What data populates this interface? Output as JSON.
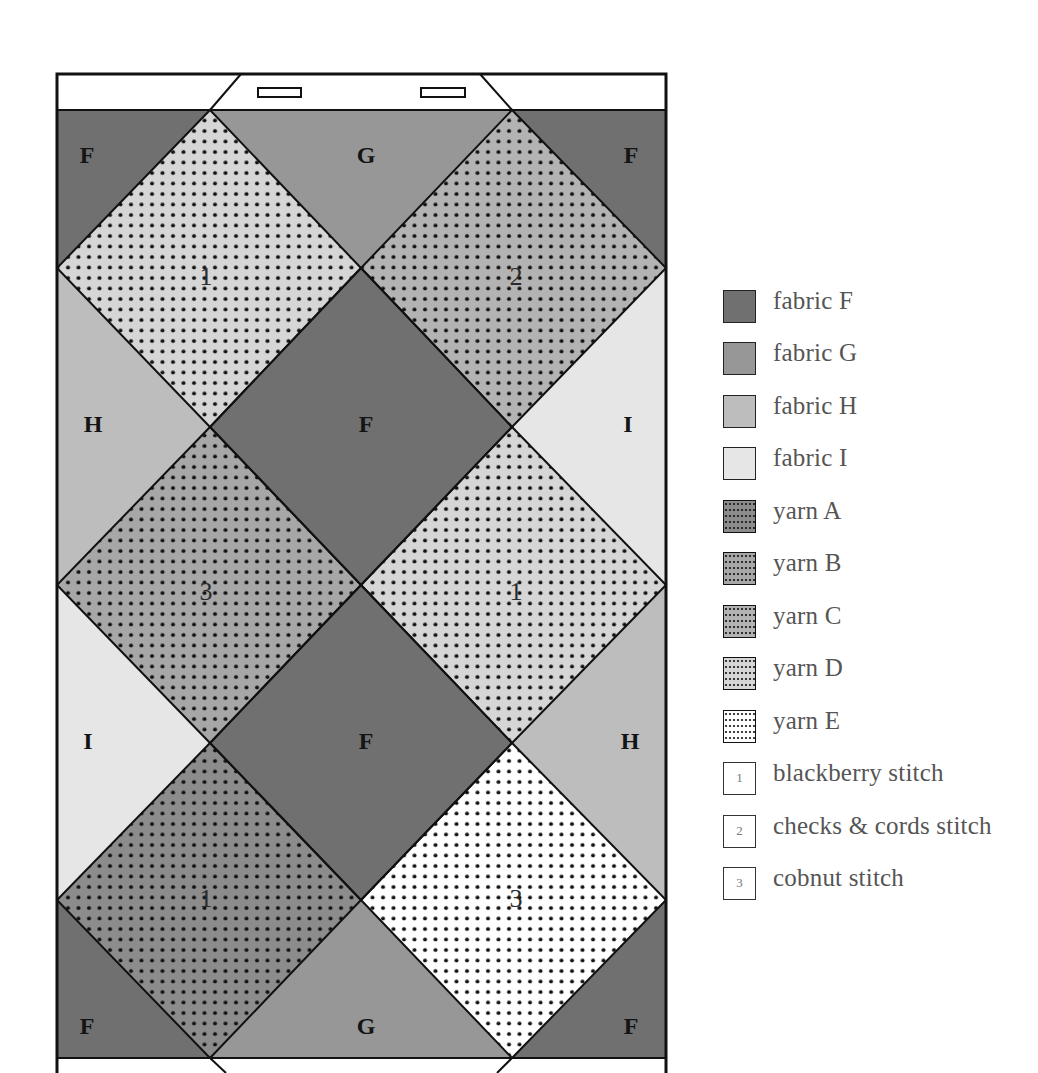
{
  "colors": {
    "fabric_F": "#707070",
    "fabric_G": "#979797",
    "fabric_H": "#bdbdbd",
    "fabric_I": "#e6e6e6",
    "yarn_A": "#8c8c8c",
    "yarn_B": "#a7a7a7",
    "yarn_C": "#b3b3b3",
    "yarn_D": "#d6d6d6",
    "yarn_E": "#ffffff",
    "outline": "#111111"
  },
  "quilt": {
    "pieces": {
      "top_left": "F",
      "top_center": "G",
      "top_right": "F",
      "mid_upper_left": "H",
      "mid_upper_center": "F",
      "mid_upper_right": "I",
      "mid_lower_left": "I",
      "mid_lower_center": "F",
      "mid_lower_right": "H",
      "bottom_left": "F",
      "bottom_center": "G",
      "bottom_right": "F"
    },
    "stitches": {
      "top_left_diamond": "1",
      "top_right_diamond": "2",
      "middle_left_diamond": "3",
      "middle_right_diamond": "1",
      "bottom_left_diamond": "1",
      "bottom_right_diamond": "3"
    }
  },
  "legend": {
    "items": [
      {
        "key": "fabric_F",
        "label": "fabric F",
        "type": "solid"
      },
      {
        "key": "fabric_G",
        "label": "fabric G",
        "type": "solid"
      },
      {
        "key": "fabric_H",
        "label": "fabric H",
        "type": "solid"
      },
      {
        "key": "fabric_I",
        "label": "fabric I",
        "type": "solid"
      },
      {
        "key": "yarn_A",
        "label": "yarn A",
        "type": "dotted"
      },
      {
        "key": "yarn_B",
        "label": "yarn B",
        "type": "dotted"
      },
      {
        "key": "yarn_C",
        "label": "yarn C",
        "type": "dotted"
      },
      {
        "key": "yarn_D",
        "label": "yarn D",
        "type": "dotted"
      },
      {
        "key": "yarn_E",
        "label": "yarn E",
        "type": "dotted"
      },
      {
        "key": "1",
        "label": "blackberry stitch",
        "type": "number"
      },
      {
        "key": "2",
        "label": "checks & cords stitch",
        "type": "number"
      },
      {
        "key": "3",
        "label": "cobnut stitch",
        "type": "number"
      }
    ]
  }
}
